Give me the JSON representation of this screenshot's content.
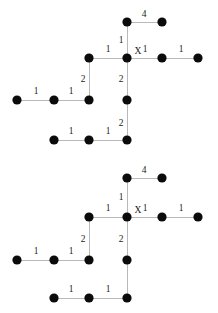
{
  "figure": {
    "type": "diagram",
    "subtype": "weighted-graph-pair",
    "background_color": "#ffffff",
    "node_color": "#0b0b0b",
    "edge_color": "#b9b9b9",
    "label_color": "#1a1a1a",
    "node_radius": 4.6,
    "graphs": [
      {
        "name": "graph-top",
        "nodes": [
          {
            "id": "g1n1",
            "x": 127,
            "y": 22,
            "label": ""
          },
          {
            "id": "g1n2",
            "x": 162,
            "y": 22,
            "label": ""
          },
          {
            "id": "g1n3",
            "x": 89,
            "y": 58,
            "label": ""
          },
          {
            "id": "g1n4",
            "x": 127,
            "y": 58,
            "label": "X"
          },
          {
            "id": "g1n5",
            "x": 162,
            "y": 58,
            "label": ""
          },
          {
            "id": "g1n6",
            "x": 198,
            "y": 58,
            "label": ""
          },
          {
            "id": "g1n7",
            "x": 17,
            "y": 100,
            "label": ""
          },
          {
            "id": "g1n8",
            "x": 54,
            "y": 100,
            "label": ""
          },
          {
            "id": "g1n9",
            "x": 89,
            "y": 100,
            "label": ""
          },
          {
            "id": "g1n10",
            "x": 127,
            "y": 100,
            "label": ""
          },
          {
            "id": "g1n11",
            "x": 54,
            "y": 140,
            "label": ""
          },
          {
            "id": "g1n12",
            "x": 89,
            "y": 140,
            "label": ""
          },
          {
            "id": "g1n13",
            "x": 127,
            "y": 140,
            "label": ""
          }
        ],
        "edges": [
          {
            "from": "g1n1",
            "to": "g1n2",
            "weight": "4",
            "lx": 144,
            "ly": 15
          },
          {
            "from": "g1n1",
            "to": "g1n4",
            "weight": "1",
            "lx": 121,
            "ly": 41
          },
          {
            "from": "g1n3",
            "to": "g1n4",
            "weight": "1",
            "lx": 108,
            "ly": 50
          },
          {
            "from": "g1n4",
            "to": "g1n5",
            "weight": "1",
            "lx": 145,
            "ly": 50
          },
          {
            "from": "g1n5",
            "to": "g1n6",
            "weight": "1",
            "lx": 181,
            "ly": 50
          },
          {
            "from": "g1n3",
            "to": "g1n9",
            "weight": "2",
            "lx": 83,
            "ly": 80
          },
          {
            "from": "g1n4",
            "to": "g1n10",
            "weight": "2",
            "lx": 121,
            "ly": 80
          },
          {
            "from": "g1n7",
            "to": "g1n8",
            "weight": "1",
            "lx": 36,
            "ly": 92
          },
          {
            "from": "g1n8",
            "to": "g1n9",
            "weight": "1",
            "lx": 71,
            "ly": 92
          },
          {
            "from": "g1n10",
            "to": "g1n13",
            "weight": "2",
            "lx": 121,
            "ly": 124
          },
          {
            "from": "g1n11",
            "to": "g1n12",
            "weight": "1",
            "lx": 71,
            "ly": 132
          },
          {
            "from": "g1n12",
            "to": "g1n13",
            "weight": "1",
            "lx": 108,
            "ly": 132
          }
        ]
      },
      {
        "name": "graph-bottom",
        "nodes": [
          {
            "id": "g2n1",
            "x": 127,
            "y": 178,
            "label": ""
          },
          {
            "id": "g2n2",
            "x": 162,
            "y": 178,
            "label": ""
          },
          {
            "id": "g2n3",
            "x": 89,
            "y": 217,
            "label": ""
          },
          {
            "id": "g2n4",
            "x": 127,
            "y": 217,
            "label": "X"
          },
          {
            "id": "g2n5",
            "x": 162,
            "y": 217,
            "label": ""
          },
          {
            "id": "g2n6",
            "x": 198,
            "y": 217,
            "label": ""
          },
          {
            "id": "g2n7",
            "x": 17,
            "y": 260,
            "label": ""
          },
          {
            "id": "g2n8",
            "x": 54,
            "y": 260,
            "label": ""
          },
          {
            "id": "g2n9",
            "x": 89,
            "y": 260,
            "label": ""
          },
          {
            "id": "g2n10",
            "x": 127,
            "y": 260,
            "label": ""
          },
          {
            "id": "g2n11",
            "x": 54,
            "y": 298,
            "label": ""
          },
          {
            "id": "g2n12",
            "x": 89,
            "y": 298,
            "label": ""
          },
          {
            "id": "g2n13",
            "x": 127,
            "y": 298,
            "label": ""
          }
        ],
        "edges": [
          {
            "from": "g2n1",
            "to": "g2n2",
            "weight": "4",
            "lx": 144,
            "ly": 171
          },
          {
            "from": "g2n1",
            "to": "g2n4",
            "weight": "1",
            "lx": 121,
            "ly": 198
          },
          {
            "from": "g2n3",
            "to": "g2n4",
            "weight": "1",
            "lx": 108,
            "ly": 209
          },
          {
            "from": "g2n4",
            "to": "g2n5",
            "weight": "1",
            "lx": 145,
            "ly": 209
          },
          {
            "from": "g2n5",
            "to": "g2n6",
            "weight": "1",
            "lx": 181,
            "ly": 209
          },
          {
            "from": "g2n3",
            "to": "g2n9",
            "weight": "2",
            "lx": 83,
            "ly": 240
          },
          {
            "from": "g2n4",
            "to": "g2n10",
            "weight": "2",
            "lx": 121,
            "ly": 240
          },
          {
            "from": "g2n7",
            "to": "g2n8",
            "weight": "1",
            "lx": 36,
            "ly": 252
          },
          {
            "from": "g2n8",
            "to": "g2n9",
            "weight": "1",
            "lx": 71,
            "ly": 252
          },
          {
            "from": "g2n10",
            "to": "g2n13",
            "weight": "",
            "lx": 121,
            "ly": 281
          },
          {
            "from": "g2n11",
            "to": "g2n12",
            "weight": "1",
            "lx": 71,
            "ly": 290
          },
          {
            "from": "g2n12",
            "to": "g2n13",
            "weight": "1",
            "lx": 108,
            "ly": 290
          }
        ]
      }
    ]
  }
}
